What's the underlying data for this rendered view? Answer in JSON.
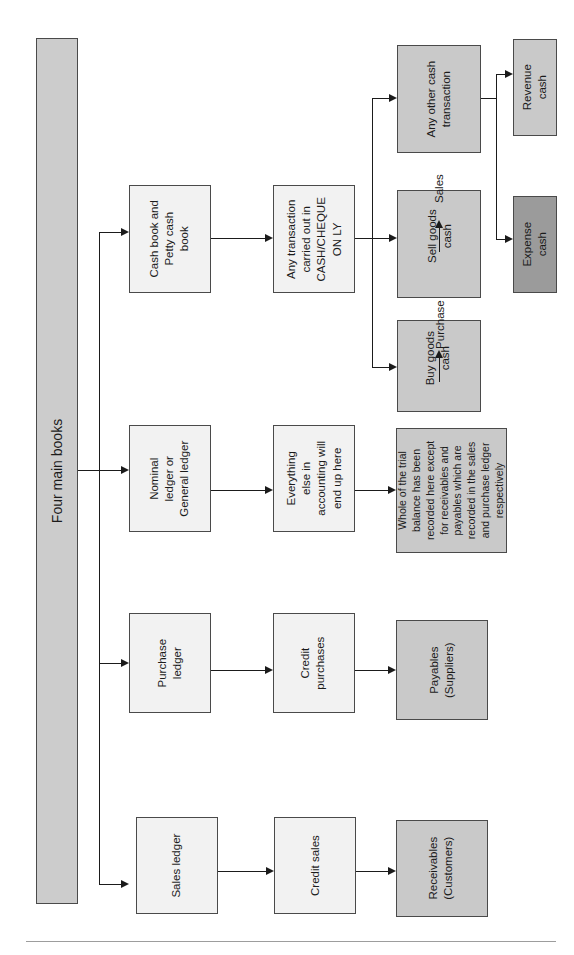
{
  "diagram": {
    "title_box": {
      "label": "Four main books"
    },
    "nodes": {
      "sales_ledger": "Sales ledger",
      "credit_sales": "Credit sales",
      "receivables": "Receivables\n(Customers)",
      "purchase_ledger": "Purchase\nledger",
      "credit_purchases": "Credit\npurchases",
      "payables": "Payables\n(Suppliers)",
      "nominal_ledger": "Nominal\nledger or\nGeneral ledger",
      "everything_else": "Everything\nelse in\naccounting will\nend up here",
      "trial_balance": "Whole of the trial\nbalance has been\nrecorded here except\nfor receivables and\npayables which are\nrecorded in the sales\nand purchase ledger\nrespectively",
      "cash_book": "Cash book and\nPetty cash\nbook",
      "any_transaction": "Any transaction\ncarried out in\nCASH/CHEQUE\nON LY",
      "any_other_cash": "Any other cash\ntransaction",
      "sell_goods_cash": "Sell goods\ncash",
      "sales": "Sales",
      "buy_goods_cash": "Buy goods\ncash",
      "purchase": "Purchase",
      "revenue_cash": "Revenue cash",
      "expense_cash": "Expense cash"
    },
    "colors": {
      "light": "#f2f2f2",
      "gray": "#c9c9c9",
      "dark": "#9b9b9b",
      "title_box": "#cccccc",
      "stroke": "#4a4a4a",
      "arrow": "#1b1b1b"
    }
  }
}
